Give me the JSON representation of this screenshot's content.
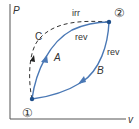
{
  "diagram": {
    "type": "P-v thermodynamic process diagram",
    "axes": {
      "y_label": "P",
      "x_label": "v"
    },
    "states": [
      {
        "id": "state-1",
        "label": "①"
      },
      {
        "id": "state-2",
        "label": "②"
      }
    ],
    "processes": [
      {
        "id": "A",
        "label": "A",
        "type_label": "rev",
        "from": "1",
        "to": "2",
        "style": "solid"
      },
      {
        "id": "B",
        "label": "B",
        "type_label": "rev",
        "from": "2",
        "to": "1",
        "style": "solid"
      },
      {
        "id": "C",
        "label": "C",
        "type_label": "irr",
        "from": "2",
        "to": "1",
        "style": "dashed"
      }
    ],
    "colors": {
      "axis": "#555555",
      "reversible_path": "#4a78b5",
      "irreversible_path": "#333333",
      "state_point": "#1f4f8a",
      "text": "#333333"
    }
  }
}
